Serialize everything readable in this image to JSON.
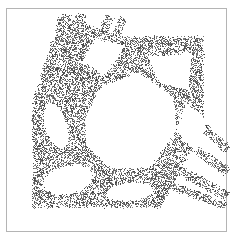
{
  "figure": {
    "name": "stipple-density-figure",
    "width": 234,
    "height": 240,
    "background_color": "#ffffff"
  },
  "frame": {
    "name": "plot-frame",
    "x": 6,
    "y": 8,
    "width": 221,
    "height": 224,
    "border_color": "#b4b4b4",
    "border_width": 1,
    "fill_color": "#ffffff"
  },
  "stipple": {
    "dot_color": "#3c3c3c",
    "dot_size": 1,
    "seed": 20240517,
    "density": 0.46,
    "edge_softness": 2.6,
    "regions": [
      {
        "name": "main-body-polygon",
        "type": "polygon",
        "points": [
          [
            34,
            100
          ],
          [
            34,
            206
          ],
          [
            160,
            206
          ],
          [
            202,
            128
          ],
          [
            202,
            38
          ],
          [
            122,
            38
          ],
          [
            74,
            22
          ],
          [
            60,
            22
          ]
        ]
      },
      {
        "name": "upper-left-band-a",
        "type": "band",
        "from": [
          66,
          14
        ],
        "to": [
          40,
          112
        ],
        "width": 9
      },
      {
        "name": "upper-left-band-b",
        "type": "band",
        "from": [
          82,
          14
        ],
        "to": [
          52,
          118
        ],
        "width": 7
      },
      {
        "name": "upper-left-band-c",
        "type": "band",
        "from": [
          110,
          16
        ],
        "to": [
          62,
          128
        ],
        "width": 6
      },
      {
        "name": "upper-left-band-d",
        "type": "band",
        "from": [
          124,
          18
        ],
        "to": [
          70,
          132
        ],
        "width": 5
      },
      {
        "name": "lower-right-band-a",
        "type": "band",
        "from": [
          186,
          112
        ],
        "to": [
          228,
          150
        ],
        "width": 6
      },
      {
        "name": "lower-right-band-b",
        "type": "band",
        "from": [
          176,
          136
        ],
        "to": [
          228,
          172
        ],
        "width": 6
      },
      {
        "name": "lower-right-band-c",
        "type": "band",
        "from": [
          160,
          160
        ],
        "to": [
          228,
          196
        ],
        "width": 7
      },
      {
        "name": "lower-right-band-d",
        "type": "band",
        "from": [
          150,
          178
        ],
        "to": [
          226,
          206
        ],
        "width": 5
      }
    ],
    "voids": [
      {
        "name": "central-void",
        "type": "polygon",
        "points": [
          [
            86,
            118
          ],
          [
            104,
            86
          ],
          [
            140,
            74
          ],
          [
            172,
            98
          ],
          [
            176,
            130
          ],
          [
            150,
            166
          ],
          [
            112,
            168
          ],
          [
            88,
            146
          ]
        ]
      },
      {
        "name": "upper-right-void",
        "type": "polygon",
        "points": [
          [
            150,
            58
          ],
          [
            190,
            54
          ],
          [
            188,
            88
          ],
          [
            160,
            82
          ]
        ]
      },
      {
        "name": "upper-mid-void",
        "type": "polygon",
        "points": [
          [
            96,
            40
          ],
          [
            124,
            46
          ],
          [
            104,
            74
          ],
          [
            84,
            62
          ]
        ]
      },
      {
        "name": "left-upper-void",
        "type": "ellipse",
        "cx": 56,
        "cy": 126,
        "rx": 10,
        "ry": 22,
        "rot": -18
      },
      {
        "name": "left-lower-void",
        "type": "ellipse",
        "cx": 68,
        "cy": 180,
        "rx": 24,
        "ry": 13,
        "rot": -12
      },
      {
        "name": "lower-mid-void",
        "type": "ellipse",
        "cx": 130,
        "cy": 192,
        "rx": 22,
        "ry": 8,
        "rot": -6
      },
      {
        "name": "right-notch-void",
        "type": "polygon",
        "points": [
          [
            186,
            104
          ],
          [
            206,
            120
          ],
          [
            196,
            150
          ],
          [
            178,
            132
          ]
        ]
      }
    ]
  },
  "chart_data": {
    "type": "scatter",
    "title": "",
    "xlabel": "",
    "ylabel": "",
    "xlim": [
      0,
      234
    ],
    "ylim": [
      0,
      240
    ],
    "grid": false,
    "legend": null,
    "series": [
      {
        "name": "stipple-points",
        "color": "#3c3c3c",
        "marker": "point",
        "marker_size": 1,
        "approx_point_count": 14000,
        "note": "Points fill a truss-like polygonal body with elliptical and polygonal voids; thin bands radiate to the upper-left and lower-right."
      }
    ]
  }
}
